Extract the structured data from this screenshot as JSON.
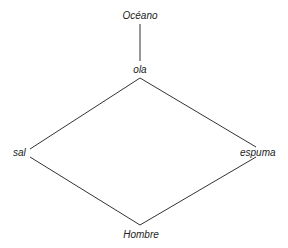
{
  "diagram": {
    "nodes": [
      {
        "id": "oceano",
        "label": "Océano"
      },
      {
        "id": "ola",
        "label": "ola"
      },
      {
        "id": "sal",
        "label": "sal"
      },
      {
        "id": "espuma",
        "label": "espuma"
      },
      {
        "id": "hombre",
        "label": "Hombre"
      }
    ],
    "edges": [
      [
        "oceano",
        "ola"
      ],
      [
        "ola",
        "sal"
      ],
      [
        "ola",
        "espuma"
      ],
      [
        "sal",
        "hombre"
      ],
      [
        "espuma",
        "hombre"
      ]
    ],
    "line_color": "#333333"
  }
}
